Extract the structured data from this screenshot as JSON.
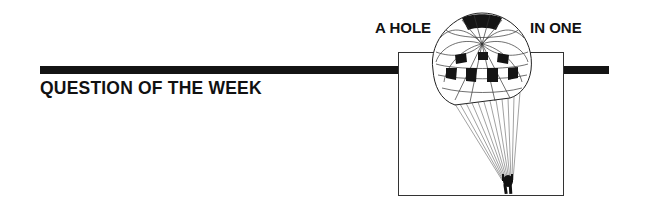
{
  "header": {
    "title_left": "A HOLE",
    "title_right": "IN ONE"
  },
  "section": {
    "heading": "QUESTION OF THE WEEK"
  },
  "illustration": {
    "subject": "parachute-icon",
    "description": "Parachutist descending under a checkered canopy inside a framed box"
  },
  "colors": {
    "ink": "#141414",
    "paper": "#ffffff"
  }
}
